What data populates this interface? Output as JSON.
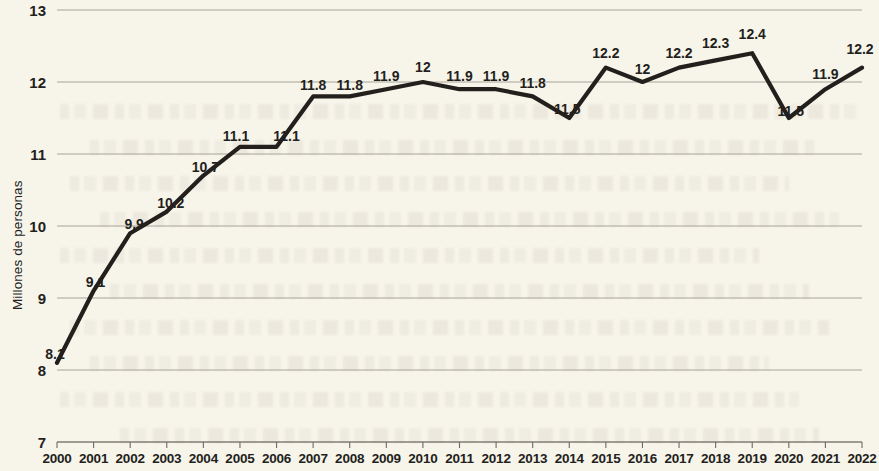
{
  "chart_data": {
    "type": "line",
    "title": "",
    "subtitle": "",
    "xlabel": "",
    "ylabel": "Millones de personas",
    "categories": [
      "2000",
      "2001",
      "2002",
      "2003",
      "2004",
      "2005",
      "2006",
      "2007",
      "2008",
      "2009",
      "2010",
      "2011",
      "2012",
      "2013",
      "2014",
      "2015",
      "2016",
      "2017",
      "2018",
      "2019",
      "2020",
      "2021",
      "2022"
    ],
    "values": [
      8.1,
      9.1,
      9.9,
      10.2,
      10.7,
      11.1,
      11.1,
      11.8,
      11.8,
      11.9,
      12,
      11.9,
      11.9,
      11.8,
      11.5,
      12.2,
      12,
      12.2,
      12.3,
      12.4,
      11.5,
      11.9,
      12.2
    ],
    "point_labels": [
      "8.1",
      "9.1",
      "9.9",
      "10.2",
      "10.7",
      "11.1",
      "11.1",
      "11.8",
      "11.8",
      "11.9",
      "12",
      "11.9",
      "11.9",
      "11.8",
      "11.5",
      "12.2",
      "12",
      "12.2",
      "12.3",
      "12.4",
      "11.5",
      "11.9",
      "12.2"
    ],
    "ylim": [
      7,
      13
    ],
    "yticks": [
      "7",
      "8",
      "9",
      "10",
      "11",
      "12",
      "13"
    ],
    "ytick_values": [
      7,
      8,
      9,
      10,
      11,
      12,
      13
    ],
    "xlim": [
      2000,
      2022
    ],
    "grid": "horizontal",
    "legend": "none",
    "series": [
      {
        "name": "Millones de personas",
        "color": "#231f1c",
        "values": [
          8.1,
          9.1,
          9.9,
          10.2,
          10.7,
          11.1,
          11.1,
          11.8,
          11.8,
          11.9,
          12,
          11.9,
          11.9,
          11.8,
          11.5,
          12.2,
          12,
          12.2,
          12.3,
          12.4,
          11.5,
          11.9,
          12.2
        ]
      }
    ],
    "colors": {
      "background": "#f7f4ea",
      "line": "#231f1c",
      "grid": "#a8a49b",
      "axis": "#6e6a63",
      "text": "#231f1c"
    }
  }
}
